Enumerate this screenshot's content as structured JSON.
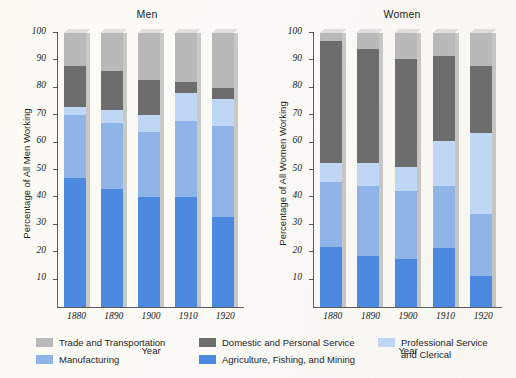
{
  "chart_data": {
    "type": "bar",
    "subtype": "stacked-column",
    "title": "",
    "panels": [
      {
        "title": "Men",
        "ylabel": "Percentage of All Men Working",
        "xlabel": "Year",
        "categories": [
          "1880",
          "1890",
          "1900",
          "1910",
          "1920"
        ],
        "ylim": [
          0,
          100
        ],
        "yticks": [
          10,
          20,
          30,
          40,
          50,
          60,
          70,
          80,
          90,
          100
        ],
        "series": [
          {
            "name": "Agriculture, Fishing, and Mining",
            "values": [
              47,
              43,
              40,
              40,
              33
            ]
          },
          {
            "name": "Manufacturing",
            "values": [
              23,
              24,
              24,
              28,
              33
            ]
          },
          {
            "name": "Professional Service and Clerical",
            "values": [
              3,
              5,
              6,
              10,
              10
            ]
          },
          {
            "name": "Domestic and Personal Service",
            "values": [
              15,
              14,
              13,
              4,
              4
            ]
          },
          {
            "name": "Trade and Transportation",
            "values": [
              12,
              14,
              17,
              18,
              20
            ]
          }
        ]
      },
      {
        "title": "Women",
        "ylabel": "Percentage of All Women Working",
        "xlabel": "Year",
        "categories": [
          "1880",
          "1890",
          "1900",
          "1910",
          "1920"
        ],
        "ylim": [
          0,
          100
        ],
        "yticks": [
          10,
          20,
          30,
          40,
          50,
          60,
          70,
          80,
          90,
          100
        ],
        "series": [
          {
            "name": "Agriculture, Fishing, and Mining",
            "values": [
              22,
              18.5,
              17.5,
              21.5,
              11.5
            ]
          },
          {
            "name": "Manufacturing",
            "values": [
              23.5,
              25.5,
              25,
              22.5,
              22.5
            ]
          },
          {
            "name": "Professional Service and Clerical",
            "values": [
              7,
              8.5,
              8.5,
              16.5,
              29.5
            ]
          },
          {
            "name": "Domestic and Personal Service",
            "values": [
              44.5,
              41.5,
              39.5,
              31,
              24.5
            ]
          },
          {
            "name": "Trade and Transportation",
            "values": [
              3,
              6,
              9.5,
              8.5,
              12
            ]
          }
        ]
      }
    ],
    "legend": {
      "position": "bottom",
      "entries": [
        {
          "label": "Trade and Transportation",
          "color": "#b9b9b9"
        },
        {
          "label": "Manufacturing",
          "color": "#8fb4e8"
        },
        {
          "label": "Domestic and Personal Service",
          "color": "#6d6d6d"
        },
        {
          "label": "Agriculture, Fishing, and Mining",
          "color": "#4b8ae0"
        },
        {
          "label": "Professional Service\nand Clerical",
          "color": "#bfd6f4"
        }
      ]
    },
    "colors": {
      "trade_and_transportation": "#b9b9b9",
      "domestic_and_personal_service": "#6d6d6d",
      "professional_service_and_clerical": "#bfd6f4",
      "manufacturing": "#8fb4e8",
      "agriculture_fishing_and_mining": "#4b8ae0",
      "axis": "#5b5b5b",
      "background": "#fbfaf5"
    }
  }
}
